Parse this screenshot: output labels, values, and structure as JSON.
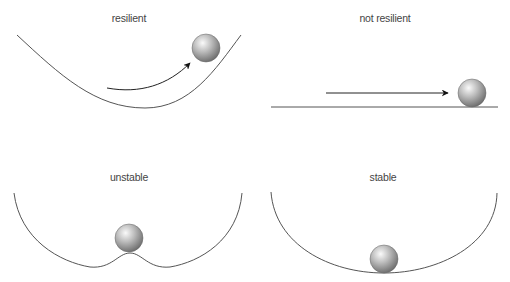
{
  "panels": [
    {
      "id": "resilient",
      "label": "resilient"
    },
    {
      "id": "not-resilient",
      "label": "not resilient"
    },
    {
      "id": "unstable",
      "label": "unstable"
    },
    {
      "id": "stable",
      "label": "stable"
    }
  ],
  "colors": {
    "curve": "#555555",
    "arrow": "#111111",
    "ball_light": "#f4f4f4",
    "ball_dark": "#7a7a7a",
    "label": "#444444"
  }
}
